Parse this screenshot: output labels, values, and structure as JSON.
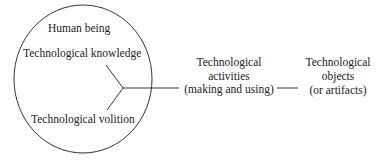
{
  "diagram": {
    "circle_title": "Human being",
    "knowledge": "Technological knowledge",
    "volition": "Technological volition",
    "activities": {
      "line1": "Technological",
      "line2": "activities",
      "line3": "(making and using)"
    },
    "objects": {
      "line1": "Technological",
      "line2": "objects",
      "line3": "(or artifacts)"
    }
  },
  "colors": {
    "stroke": "#333333",
    "text": "#222222",
    "background": "#ffffff"
  }
}
